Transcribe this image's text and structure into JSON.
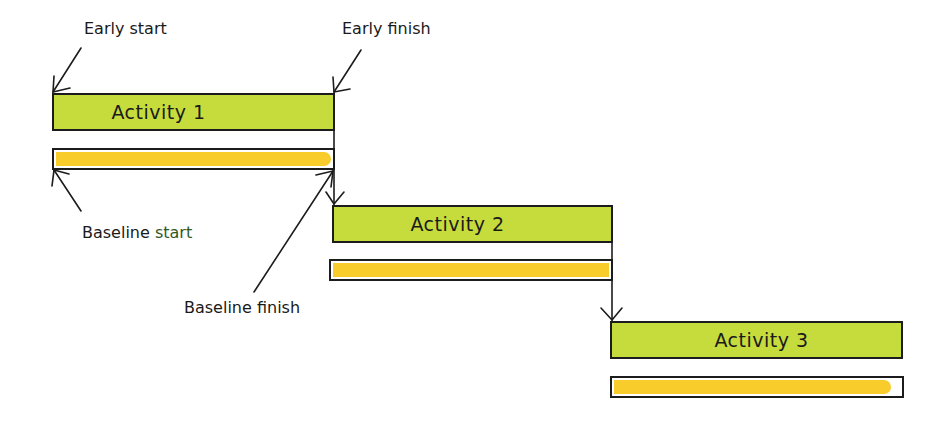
{
  "diagram": {
    "type": "gantt-schedule-annotation",
    "colors": {
      "activity_fill": "#c6dc3d",
      "baseline_fill": "#f8cc2a",
      "outline": "#1c1c1c"
    },
    "activities": [
      {
        "label": "Activity 1"
      },
      {
        "label": "Activity 2"
      },
      {
        "label": "Activity 3"
      }
    ],
    "annotations": {
      "early_start": "Early start",
      "early_finish": "Early finish",
      "baseline_start_prefix": "Baseline",
      "baseline_start_suffix": "start",
      "baseline_finish": "Baseline finish"
    },
    "dependencies": [
      {
        "from": "Activity 1",
        "to": "Activity 2",
        "type": "finish-to-start"
      },
      {
        "from": "Activity 2",
        "to": "Activity 3",
        "type": "finish-to-start"
      }
    ]
  }
}
